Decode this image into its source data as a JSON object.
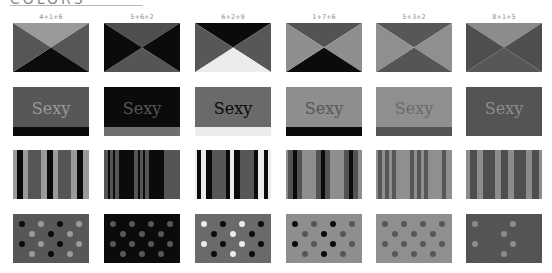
{
  "heading": {
    "text": "COLORS"
  },
  "combos": [
    {
      "label": "4+1+6",
      "c1": "#9a9a9a",
      "c2": "#565656",
      "c3": "#0c0c0c",
      "c4": "#565656"
    },
    {
      "label": "5+6+2",
      "c1": "#4e4e4e",
      "c2": "#0b0b0b",
      "c3": "#555555",
      "c4": "#0b0b0b"
    },
    {
      "label": "6+2+9",
      "c1": "#0b0b0b",
      "c2": "#575757",
      "c3": "#ececec",
      "c4": "#575757"
    },
    {
      "label": "1+7+6",
      "c1": "#535353",
      "c2": "#8e8e8e",
      "c3": "#0b0b0b",
      "c4": "#8e8e8e"
    },
    {
      "label": "5+3+2",
      "c1": "#575757",
      "c2": "#8f8f8f",
      "c3": "#555555",
      "c4": "#8f8f8f"
    },
    {
      "label": "8+1+5",
      "c1": "#8c8c8c",
      "c2": "#4e4e4e",
      "c3": "#575757",
      "c4": "#4e4e4e"
    }
  ],
  "sexy_text": "Sexy",
  "sexy": [
    {
      "bg": "#575757",
      "text": "#9a9a9a",
      "bar": "#0b0b0b"
    },
    {
      "bg": "#0b0b0b",
      "text": "#575757",
      "bar": "#6f6f6f"
    },
    {
      "bg": "#6a6a6a",
      "text": "#0b0b0b",
      "bar": "#ececec"
    },
    {
      "bg": "#8e8e8e",
      "text": "#575757",
      "bar": "#0b0b0b"
    },
    {
      "bg": "#8f8f8f",
      "text": "#6a6a6a",
      "bar": "#555555"
    },
    {
      "bg": "#545454",
      "text": "#8c8c8c",
      "bar": "#545454"
    }
  ],
  "stripes": [
    {
      "colors": [
        "#9a9a9a",
        "#0b0b0b",
        "#9a9a9a",
        "#565656",
        "#9a9a9a",
        "#0b0b0b",
        "#9a9a9a",
        "#565656",
        "#9a9a9a",
        "#0b0b0b",
        "#9a9a9a"
      ],
      "widths": [
        4,
        6,
        5,
        13,
        6,
        6,
        5,
        13,
        6,
        6,
        6
      ]
    },
    {
      "colors": [
        "#555555",
        "#0b0b0b",
        "#555555",
        "#0b0b0b",
        "#555555",
        "#0b0b0b",
        "#555555",
        "#0b0b0b",
        "#555555",
        "#0b0b0b",
        "#555555",
        "#0b0b0b",
        "#555555"
      ],
      "widths": [
        4,
        2,
        3,
        2,
        4,
        15,
        4,
        2,
        3,
        2,
        4,
        15,
        16
      ]
    },
    {
      "colors": [
        "#ececec",
        "#0b0b0b",
        "#ececec",
        "#0b0b0b",
        "#575757",
        "#0b0b0b",
        "#ececec",
        "#0b0b0b",
        "#575757",
        "#0b0b0b",
        "#ececec",
        "#0b0b0b",
        "#ececec"
      ],
      "widths": [
        2,
        4,
        5,
        6,
        14,
        4,
        4,
        6,
        14,
        4,
        6,
        4,
        3
      ]
    },
    {
      "colors": [
        "#8e8e8e",
        "#535353",
        "#0b0b0b",
        "#535353",
        "#8e8e8e",
        "#535353",
        "#0b0b0b",
        "#535353",
        "#8e8e8e",
        "#535353",
        "#0b0b0b",
        "#535353",
        "#8e8e8e"
      ],
      "widths": [
        2,
        5,
        4,
        5,
        14,
        5,
        4,
        5,
        14,
        5,
        4,
        5,
        4
      ]
    },
    {
      "colors": [
        "#8f8f8f",
        "#575757",
        "#8f8f8f",
        "#575757",
        "#8f8f8f",
        "#575757",
        "#8f8f8f",
        "#575757",
        "#8f8f8f",
        "#575757",
        "#8f8f8f",
        "#575757",
        "#8f8f8f",
        "#575757",
        "#8f8f8f"
      ],
      "widths": [
        2,
        4,
        3,
        4,
        3,
        4,
        14,
        4,
        3,
        4,
        3,
        4,
        14,
        4,
        6
      ]
    },
    {
      "colors": [
        "#8c8c8c",
        "#4e4e4e",
        "#8c8c8c",
        "#4e4e4e",
        "#8c8c8c",
        "#4e4e4e",
        "#8c8c8c",
        "#4e4e4e",
        "#8c8c8c",
        "#4e4e4e",
        "#8c8c8c"
      ],
      "widths": [
        4,
        7,
        6,
        12,
        6,
        7,
        6,
        12,
        6,
        7,
        3
      ]
    }
  ],
  "dots": [
    {
      "bg": "#575757",
      "a": "#0b0b0b",
      "b": "#9a9a9a"
    },
    {
      "bg": "#0b0b0b",
      "a": "#575757",
      "b": "#575757"
    },
    {
      "bg": "#6a6a6a",
      "a": "#ececec",
      "b": "#0b0b0b"
    },
    {
      "bg": "#8e8e8e",
      "a": "#0b0b0b",
      "b": "#575757"
    },
    {
      "bg": "#8f8f8f",
      "a": "#575757",
      "b": "#575757"
    },
    {
      "bg": "#545454",
      "a": "#8c8c8c",
      "b": "#545454"
    }
  ],
  "layout": {
    "cols_x": [
      13,
      104,
      195,
      286,
      376,
      466
    ],
    "rows_y": [
      23,
      87,
      150,
      214
    ]
  }
}
